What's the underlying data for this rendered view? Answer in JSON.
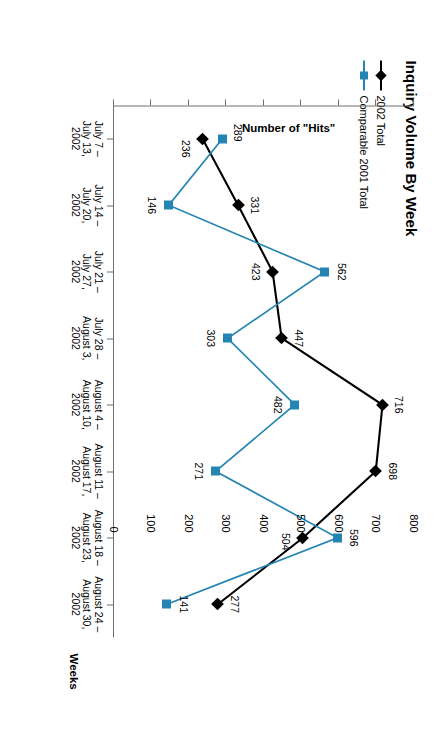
{
  "chart_data": {
    "type": "line",
    "title": "Inquiry Volume By Week",
    "xlabel": "Weeks",
    "ylabel": "Number of \"Hits\"",
    "ylim": [
      0,
      800
    ],
    "yticks": [
      0,
      100,
      200,
      300,
      400,
      500,
      600,
      700,
      800
    ],
    "grid": false,
    "legend_position": "top-left",
    "categories": [
      "July 7 –\nJuly 13,\n2002",
      "July 14 –\nJuly 20,\n2002",
      "July 21 –\nJuly 27,\n2002",
      "July 28 –\nAugust 3,\n2002",
      "August 4 –\nAugust 10,\n2002",
      "August 11 –\nAugust 17,\n2002",
      "August 18 –\nAugust 23,\n2002",
      "August 24 –\nAugust 30,\n2002"
    ],
    "series": [
      {
        "name": "2002 Total",
        "color": "#000000",
        "marker": "diamond",
        "values": [
          236,
          331,
          423,
          447,
          716,
          698,
          504,
          277
        ]
      },
      {
        "name": "Comparable 2001 Total",
        "color": "#2585B2",
        "marker": "square",
        "values": [
          289,
          146,
          562,
          303,
          482,
          271,
          596,
          141
        ]
      }
    ]
  },
  "colors": {
    "series_2002": "#000000",
    "series_2001": "#2585B2",
    "axis": "#6e6e6e",
    "background": "#ffffff"
  }
}
